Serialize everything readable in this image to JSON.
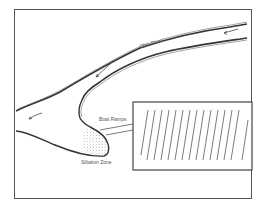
{
  "diagram": {
    "labels": {
      "river": "Ohio River",
      "ramps": "Boat Ramps",
      "silt": "Siltation Zone"
    },
    "inset": {
      "hatch_count": 15
    },
    "colors": {
      "ink": "#444444",
      "frame": "#555555",
      "background": "#ffffff"
    }
  }
}
